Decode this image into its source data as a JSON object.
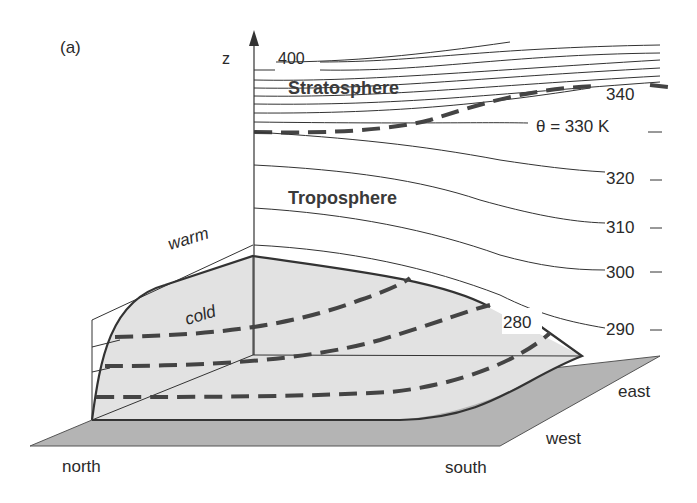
{
  "figure": {
    "panel_label": "(a)",
    "axis_label": "z",
    "regions": {
      "stratosphere": "Stratosphere",
      "troposphere": "Troposphere"
    },
    "air_masses": {
      "warm": "warm",
      "cold": "cold"
    },
    "directions": {
      "north": "north",
      "south": "south",
      "west": "west",
      "east": "east"
    },
    "isentrope_labels": {
      "t400": "400",
      "t340": "340",
      "t330": "θ = 330 K",
      "t320": "320",
      "t310": "310",
      "t300": "300",
      "t290": "290",
      "t280": "280"
    },
    "colors": {
      "ground": "#b4b4b4",
      "cold_dome": "#e2e2e2",
      "line": "#333333",
      "tropopause": "#444444"
    }
  }
}
